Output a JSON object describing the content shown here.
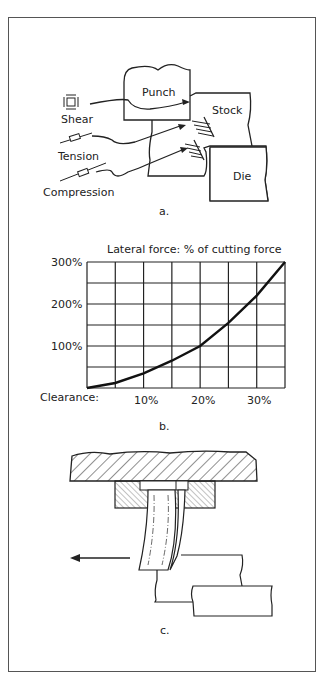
{
  "panel_a": {
    "caption": "a.",
    "labels": {
      "punch": "Punch",
      "stock": "Stock",
      "die": "Die",
      "shear": "Shear",
      "tension": "Tension",
      "compression": "Compression"
    }
  },
  "panel_b": {
    "caption": "b.",
    "title": "Lateral force: % of cutting force",
    "y_ticks": [
      "300%",
      "200%",
      "100%"
    ],
    "x_label": "Clearance:",
    "x_ticks": [
      "10%",
      "20%",
      "30%"
    ]
  },
  "panel_c": {
    "caption": "c."
  },
  "chart_data": {
    "type": "line",
    "title": "Lateral force: % of cutting force",
    "xlabel": "Clearance",
    "ylabel": "Lateral force (% of cutting force)",
    "x": [
      0,
      5,
      10,
      15,
      20,
      25,
      30,
      35
    ],
    "series": [
      {
        "name": "Lateral force",
        "values": [
          0,
          12,
          35,
          65,
          100,
          155,
          220,
          300
        ]
      }
    ],
    "xlim": [
      0,
      35
    ],
    "ylim": [
      0,
      300
    ],
    "x_tick_labels": [
      "10%",
      "20%",
      "30%"
    ],
    "y_tick_labels": [
      "100%",
      "200%",
      "300%"
    ],
    "grid": true,
    "legend": "none"
  }
}
